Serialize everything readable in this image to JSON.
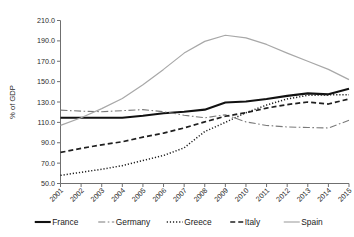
{
  "chart_data": {
    "type": "line",
    "title": "",
    "xlabel": "",
    "ylabel": "% of GDP",
    "ylim": [
      50.0,
      210.0
    ],
    "ytick_step": 20.0,
    "ytick_labels": [
      "50.0",
      "70.0",
      "90.0",
      "110.0",
      "130.0",
      "150.0",
      "170.0",
      "190.0",
      "210.0"
    ],
    "yticks": [
      50.0,
      70.0,
      90.0,
      110.0,
      130.0,
      150.0,
      170.0,
      190.0,
      210.0
    ],
    "grid": false,
    "legend_position": "bottom",
    "categories": [
      "2001",
      "2002",
      "2003",
      "2004",
      "2005",
      "2006",
      "2007",
      "2008",
      "2009",
      "2010",
      "2011",
      "2012",
      "2013",
      "2014",
      "2015"
    ],
    "x": [
      2001,
      2002,
      2003,
      2004,
      2005,
      2006,
      2007,
      2008,
      2009,
      2010,
      2011,
      2012,
      2013,
      2014,
      2015
    ],
    "series": [
      {
        "name": "France",
        "style": "solid",
        "color": "#111111",
        "width": 2.1,
        "dash": "",
        "values": [
          114.5,
          114.5,
          114.5,
          114.5,
          116.5,
          119.0,
          120.5,
          122.5,
          129.5,
          130.5,
          133.0,
          136.0,
          138.5,
          137.5,
          143.0
        ]
      },
      {
        "name": "Germany",
        "style": "dash-dot",
        "color": "#7a7a7a",
        "width": 1.1,
        "dash": "7,2.5,1.6,2.5",
        "values": [
          122.0,
          121.0,
          120.5,
          121.5,
          122.5,
          120.5,
          117.0,
          114.5,
          117.5,
          110.5,
          107.0,
          105.5,
          105.0,
          104.5,
          112.0
        ]
      },
      {
        "name": "Greece",
        "style": "dotted",
        "color": "#1f1f1f",
        "width": 1.5,
        "dash": "1.2,1.9",
        "values": [
          58.0,
          61.0,
          64.0,
          67.5,
          72.5,
          77.5,
          85.0,
          101.0,
          110.0,
          119.5,
          127.0,
          133.0,
          136.5,
          137.0,
          137.0
        ]
      },
      {
        "name": "Italy",
        "style": "dashed",
        "color": "#1f1f1f",
        "width": 1.7,
        "dash": "5,3",
        "values": [
          80.5,
          84.5,
          88.0,
          91.0,
          95.5,
          99.5,
          104.5,
          110.5,
          116.0,
          119.5,
          124.0,
          127.5,
          130.0,
          128.0,
          133.0
        ]
      },
      {
        "name": "Spain",
        "style": "solid",
        "color": "#a8a8a8",
        "width": 1.2,
        "dash": "",
        "values": [
          107.0,
          114.5,
          123.5,
          133.5,
          147.0,
          162.0,
          178.0,
          189.5,
          195.5,
          193.0,
          186.5,
          178.0,
          170.0,
          162.0,
          152.0
        ]
      }
    ]
  },
  "legend": {
    "items": [
      {
        "label": "France"
      },
      {
        "label": "Germany"
      },
      {
        "label": "Greece"
      },
      {
        "label": "Italy"
      },
      {
        "label": "Spain"
      }
    ]
  }
}
